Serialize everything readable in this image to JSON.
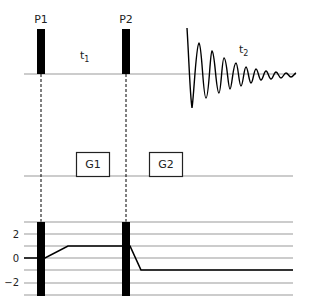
{
  "diagram": {
    "title": "",
    "pulses": [
      {
        "label": "P1",
        "x": 41
      },
      {
        "label": "P2",
        "x": 126
      }
    ],
    "delays": [
      {
        "label": "t",
        "subscript": "1"
      },
      {
        "label": "t",
        "subscript": "2"
      }
    ],
    "gradients": [
      {
        "label": "G1"
      },
      {
        "label": "G2"
      }
    ],
    "coherence_axis": {
      "tick_labels": [
        "2",
        "0",
        "−2"
      ],
      "levels": [
        3,
        2,
        1,
        0,
        -1,
        -2,
        -3
      ]
    },
    "coherence_pathway": [
      {
        "segment": "start",
        "level": 0
      },
      {
        "segment": "after_P1",
        "level": 1
      },
      {
        "segment": "after_P2",
        "level": -1
      }
    ],
    "colors": {
      "pulse": "#000000",
      "axis": "#999999",
      "text": "#222222"
    }
  }
}
